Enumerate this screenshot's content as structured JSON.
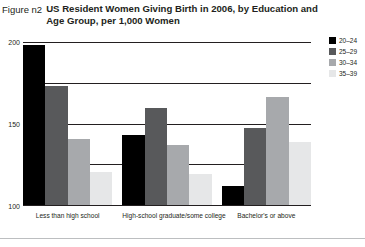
{
  "figure": {
    "label": "Figure n2",
    "title": "US Resident Women Giving Birth in 2006, by Education and Age Group, per 1,000 Women"
  },
  "legend": {
    "position": "top-right",
    "items": [
      {
        "label": "20–24",
        "color": "#000000"
      },
      {
        "label": "25–29",
        "color": "#58595b"
      },
      {
        "label": "30–34",
        "color": "#a7a9ac"
      },
      {
        "label": "35–39",
        "color": "#e6e7e8"
      }
    ]
  },
  "chart_data": {
    "type": "bar",
    "title": "US Resident Women Giving Birth in 2006, by Education and Age Group, per 1,000 Women",
    "xlabel": "",
    "ylabel": "",
    "ylim": [
      0,
      200
    ],
    "yticks": [
      0,
      50,
      100,
      150,
      200
    ],
    "ytick_labels": [
      "0",
      "50",
      "100",
      "150",
      "200"
    ],
    "grid": true,
    "legend_position": "top-right",
    "categories": [
      "Less than high school",
      "High-school graduate/some college",
      "Bachelor's or above"
    ],
    "series": [
      {
        "name": "20–24",
        "color": "#000000",
        "values": [
          196,
          86,
          23
        ]
      },
      {
        "name": "25–29",
        "color": "#58595b",
        "values": [
          146,
          119,
          94
        ]
      },
      {
        "name": "30–34",
        "color": "#a7a9ac",
        "values": [
          81,
          74,
          133
        ]
      },
      {
        "name": "35–39",
        "color": "#e6e7e8",
        "values": [
          40,
          38,
          77
        ]
      }
    ]
  }
}
